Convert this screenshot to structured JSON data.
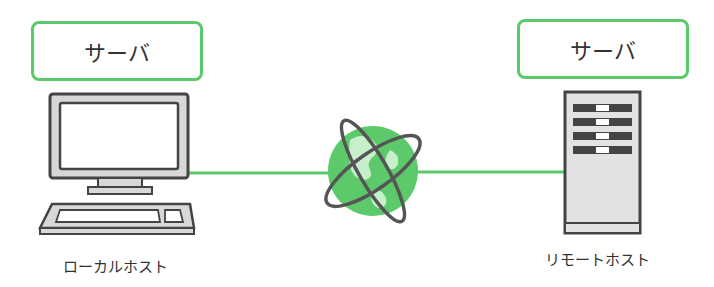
{
  "diagram": {
    "left_node": {
      "tag": "サーバ",
      "caption": "ローカルホスト",
      "device": "desktop-computer"
    },
    "right_node": {
      "tag": "サーバ",
      "caption": "リモートホスト",
      "device": "server-tower"
    },
    "center": {
      "icon": "globe-internet"
    },
    "colors": {
      "accent": "#5cc96a",
      "line": "#5cc96a",
      "device_stroke": "#555555",
      "device_fill": "#e4e4e4",
      "globe": "#4fbf63"
    }
  }
}
